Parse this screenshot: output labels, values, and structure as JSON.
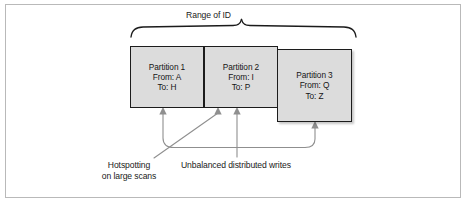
{
  "figure": {
    "title_label": "Range of ID",
    "colors": {
      "box_fill": "#dcdcdc",
      "box_stroke": "#1c1c1c",
      "connector": "#8c8c8c",
      "frame": "#b9b9b9",
      "text": "#1a1a1a"
    }
  },
  "partitions": [
    {
      "name": "Partition 1",
      "from": "From: A",
      "to": "To: H"
    },
    {
      "name": "Partition 2",
      "from": "From: I",
      "to": "To: P"
    },
    {
      "name": "Partition 3",
      "from": "From: Q",
      "to": "To: Z"
    }
  ],
  "annotations": {
    "hotspotting_line1": "Hotspotting",
    "hotspotting_line2": "on large scans",
    "unbalanced": "Unbalanced distributed writes"
  }
}
